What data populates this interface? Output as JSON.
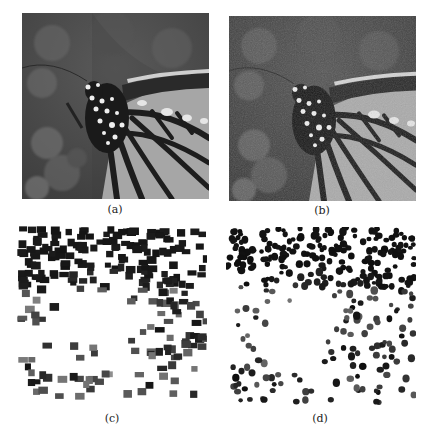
{
  "figure": {
    "panels": [
      {
        "id": "a",
        "caption": "(a)",
        "content": "grayscale photo of monarch butterfly wing and body"
      },
      {
        "id": "b",
        "caption": "(b)",
        "content": "noisy / reconstructed version of butterfly photo"
      },
      {
        "id": "c",
        "caption": "(c)",
        "content": "square-block pattern pixel map"
      },
      {
        "id": "d",
        "caption": "(d)",
        "content": "round-dot pattern pixel map"
      }
    ],
    "colors": {
      "background": "#ffffff",
      "photo_bg_dark": "#4a4a4a",
      "wing_light": "#a8a8a8",
      "vein_dark": "#1e1e1e",
      "spot_white": "#f0f0f0",
      "pattern_dark": "#1a1a1a"
    }
  }
}
